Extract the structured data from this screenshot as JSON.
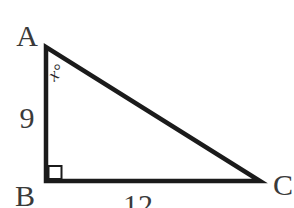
{
  "figure": {
    "vertex_labels": {
      "a": "A",
      "b": "B",
      "c": "C"
    },
    "angle_label": "x°",
    "side_labels": {
      "ab": "9",
      "bc": "12"
    },
    "colors": {
      "line": "#1b1b1b",
      "text": "#3a3a3a",
      "background": "#ffffff"
    }
  }
}
